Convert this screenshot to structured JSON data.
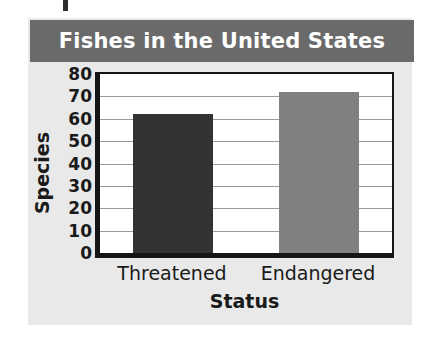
{
  "chart_data": {
    "type": "bar",
    "title": "Fishes in the United States",
    "xlabel": "Status",
    "ylabel": "Species",
    "categories": [
      "Threatened",
      "Endangered"
    ],
    "values": [
      62,
      72
    ],
    "series": [
      {
        "name": "Species",
        "values": [
          62,
          72
        ]
      }
    ],
    "ylim": [
      0,
      80
    ],
    "yticks": [
      0,
      10,
      20,
      30,
      40,
      50,
      60,
      70,
      80
    ],
    "ytick_labels": [
      "0",
      "10",
      "20",
      "30",
      "40",
      "50",
      "60",
      "70",
      "80"
    ],
    "grid": true,
    "grid_axis": "y",
    "legend": false,
    "legend_position": "none",
    "bar_colors": [
      "#333333",
      "#808080"
    ],
    "annotations": []
  },
  "colors": {
    "panel_background": "#e9e9e9",
    "title_bar_background": "#6a6a6a",
    "title_text": "#ffffff",
    "plot_background": "#ffffff",
    "axis_line": "#151515",
    "gridline": "#9a9a9a",
    "label_text": "#1a1a1a",
    "bar_threatened": "#333333",
    "bar_endangered": "#808080"
  }
}
